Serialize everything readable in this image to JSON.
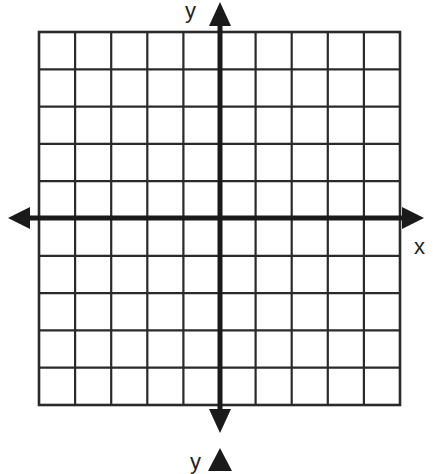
{
  "diagram": {
    "type": "coordinate-plane",
    "grid": {
      "columns": 10,
      "rows": 10,
      "left": 39,
      "top": 32,
      "right": 400,
      "bottom": 405
    },
    "axes": {
      "x_axis": {
        "label": "x",
        "y_position": 218,
        "arrow_left_x": 8,
        "arrow_right_x": 424
      },
      "y_axis": {
        "label": "y",
        "x_position": 220,
        "arrow_top_y": 2,
        "arrow_bottom_y": 433
      },
      "stray_label": {
        "label": "y"
      }
    },
    "colors": {
      "grid": "#2a2a2a",
      "axis": "#1a1a1a",
      "background": "#ffffff"
    }
  }
}
